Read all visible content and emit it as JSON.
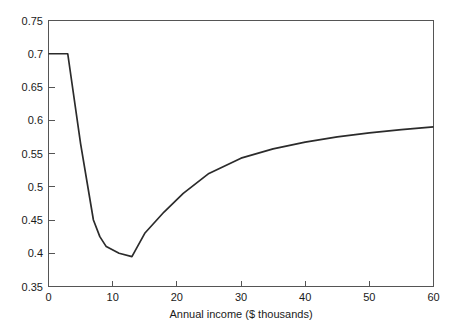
{
  "chart_data": {
    "type": "line",
    "title": "",
    "subtitle": "",
    "xlabel": "Annual income ($ thousands)",
    "ylabel": "",
    "xlim": [
      0,
      60
    ],
    "ylim": [
      0.35,
      0.75
    ],
    "grid": false,
    "legend": null,
    "line_color": "#2b2b2b",
    "frame_color": "#555555",
    "xticks": [
      0,
      10,
      20,
      30,
      40,
      50,
      60
    ],
    "xtick_labels": [
      "0",
      "10",
      "20",
      "30",
      "40",
      "50",
      "60"
    ],
    "yticks": [
      0.35,
      0.4,
      0.45,
      0.5,
      0.55,
      0.6,
      0.65,
      0.7,
      0.75
    ],
    "ytick_labels": [
      "0.35",
      "0.4",
      "0.45",
      "0.5",
      "0.55",
      "0.6",
      "0.65",
      "0.7",
      "0.75"
    ],
    "series": [
      {
        "name": "curve",
        "x": [
          0,
          3,
          5,
          7,
          8,
          9,
          11,
          13,
          15,
          18,
          21,
          25,
          30,
          35,
          40,
          45,
          50,
          55,
          60
        ],
        "y": [
          0.7,
          0.7,
          0.565,
          0.45,
          0.425,
          0.41,
          0.4,
          0.395,
          0.43,
          0.462,
          0.49,
          0.52,
          0.543,
          0.557,
          0.567,
          0.575,
          0.581,
          0.586,
          0.59
        ]
      }
    ]
  }
}
